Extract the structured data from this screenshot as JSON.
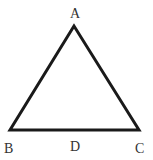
{
  "diagram": {
    "type": "triangle",
    "stroke_color": "#1a1a1a",
    "label_color": "#333333",
    "vertices": [
      {
        "name": "A",
        "x": 74,
        "y": 26
      },
      {
        "name": "B",
        "x": 10,
        "y": 130
      },
      {
        "name": "C",
        "x": 139,
        "y": 130
      }
    ],
    "points": [
      {
        "name": "D",
        "on_segment": "BC"
      }
    ],
    "labels": {
      "A": "A",
      "B": "B",
      "C": "C",
      "D": "D"
    }
  }
}
